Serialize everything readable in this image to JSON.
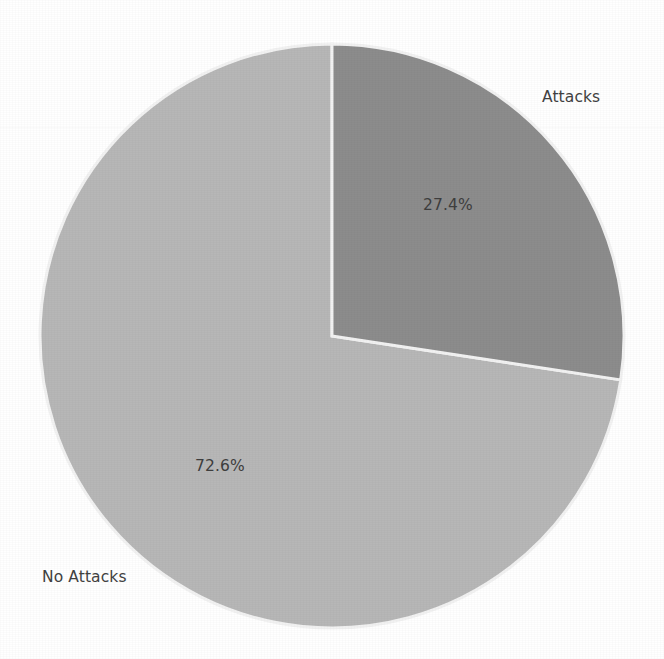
{
  "chart_data": {
    "type": "pie",
    "title": "",
    "subtitle": "",
    "xlabel": "",
    "ylabel": "",
    "legend_position": "none",
    "grid": false,
    "start_angle_deg": 90,
    "direction": "clockwise",
    "categories": [
      "Attacks",
      "No Attacks"
    ],
    "values": [
      27.4,
      72.6
    ],
    "value_unit": "percent",
    "labels": [
      "Attacks",
      "No Attacks"
    ],
    "data_labels": [
      "27.4%",
      "72.6%"
    ],
    "colors": [
      "#8c8c8c",
      "#b7b7b7"
    ],
    "slices": [
      {
        "name": "Attacks",
        "value": 27.4,
        "data_label": "27.4%",
        "color": "#8c8c8c",
        "start_angle_deg": 0,
        "end_angle_deg": 98.64
      },
      {
        "name": "No Attacks",
        "value": 72.6,
        "data_label": "72.6%",
        "color": "#b7b7b7",
        "start_angle_deg": 98.64,
        "end_angle_deg": 360
      }
    ]
  },
  "figure": {
    "background_color": "#ffffff",
    "wedge_edge_color": "#f2f2f2",
    "text_color": "#404040",
    "center_x": 332,
    "center_y": 336,
    "radius": 292
  },
  "labels": {
    "attacks": "Attacks",
    "no_attacks": "No Attacks",
    "attacks_pct": "27.4%",
    "no_attacks_pct": "72.6%"
  }
}
